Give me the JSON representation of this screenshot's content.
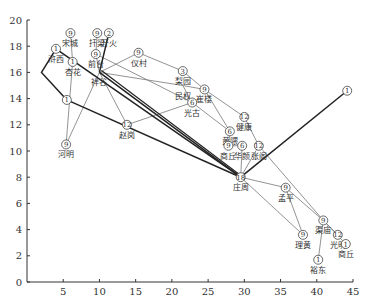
{
  "chart_data": {
    "type": "network-diagram",
    "title": "",
    "xlabel": "",
    "ylabel": "",
    "xlim": [
      0,
      45
    ],
    "ylim": [
      0,
      20
    ],
    "x_ticks": [
      5,
      10,
      15,
      20,
      25,
      30,
      35,
      40,
      45
    ],
    "y_ticks": [
      0,
      2,
      4,
      6,
      8,
      10,
      12,
      14,
      16,
      18,
      20
    ],
    "grid": false,
    "nodes": [
      {
        "id": "songcheng",
        "label": "宋城",
        "num": "9",
        "x": 6.0,
        "y": 19.0
      },
      {
        "id": "fuliang",
        "label": "扦梁",
        "num": "9",
        "x": 9.7,
        "y": 19.0
      },
      {
        "id": "kaihuo",
        "label": "开火",
        "num": "2",
        "x": 11.3,
        "y": 19.0
      },
      {
        "id": "huxi",
        "label": "浒西",
        "num": "1",
        "x": 4.0,
        "y": 17.8
      },
      {
        "id": "qiantai",
        "label": "前台",
        "num": "9",
        "x": 9.5,
        "y": 17.4
      },
      {
        "id": "yicun",
        "label": "仪村",
        "num": "9",
        "x": 15.4,
        "y": 17.5
      },
      {
        "id": "xinghua",
        "label": "杏花",
        "num": "1",
        "x": 6.3,
        "y": 16.8
      },
      {
        "id": "lishi",
        "label": "祥谷",
        "num": "",
        "x": 10.0,
        "y": 16.0
      },
      {
        "id": "liyuan",
        "label": "梨园",
        "num": "3",
        "x": 21.5,
        "y": 16.1
      },
      {
        "id": "minquan",
        "label": "民权",
        "num": "",
        "x": 21.5,
        "y": 15.0
      },
      {
        "id": "cuilou",
        "label": "崔楼",
        "num": "9",
        "x": 24.5,
        "y": 14.7
      },
      {
        "id": "guangu",
        "label": "光古",
        "num": "6",
        "x": 22.8,
        "y": 13.7
      },
      {
        "id": "zhaogang",
        "label": "赵岗",
        "num": "12",
        "x": 13.8,
        "y": 12.0
      },
      {
        "id": "junction14",
        "label": "",
        "num": "1",
        "x": 5.5,
        "y": 13.9
      },
      {
        "id": "jiankang",
        "label": "健康",
        "num": "12",
        "x": 30.0,
        "y": 12.6
      },
      {
        "id": "gaozhu",
        "label": "黄隈",
        "num": "6",
        "x": 28.0,
        "y": 11.5
      },
      {
        "id": "huajian",
        "label": "华颜",
        "num": "6",
        "x": 29.7,
        "y": 10.4
      },
      {
        "id": "shangqiu_n",
        "label": "商丘",
        "num": "9",
        "x": 27.8,
        "y": 10.4
      },
      {
        "id": "zhanglou",
        "label": "张阁",
        "num": "12",
        "x": 32.0,
        "y": 10.4
      },
      {
        "id": "heming",
        "label": "河明",
        "num": "9",
        "x": 5.4,
        "y": 10.5
      },
      {
        "id": "zhuangzhou",
        "label": "庄周",
        "num": "18",
        "x": 29.5,
        "y": 8.0
      },
      {
        "id": "east1",
        "label": "",
        "num": "1",
        "x": 44.2,
        "y": 14.6
      },
      {
        "id": "mengping",
        "label": "孟平",
        "num": "9",
        "x": 35.7,
        "y": 7.2
      },
      {
        "id": "lianmiao",
        "label": "渠庙",
        "num": "9",
        "x": 40.9,
        "y": 4.7
      },
      {
        "id": "guangming",
        "label": "光明",
        "num": "12",
        "x": 42.9,
        "y": 3.6
      },
      {
        "id": "liangying",
        "label": "理黄",
        "num": "9",
        "x": 38.1,
        "y": 3.6
      },
      {
        "id": "shangqiu_s",
        "label": "商丘",
        "num": "1",
        "x": 44.0,
        "y": 2.9
      },
      {
        "id": "yudong",
        "label": "裕东",
        "num": "1",
        "x": 40.2,
        "y": 1.7
      }
    ],
    "thick_edges": [
      [
        "huxi",
        "zhuangzhou"
      ],
      [
        "lishi",
        "zhuangzhou"
      ],
      [
        "kaihuo",
        "lishi"
      ],
      [
        "zhuangzhou",
        "east1"
      ],
      [
        "junction14",
        "zhuangzhou"
      ]
    ],
    "thin_edges": [
      [
        "songcheng",
        "xinghua"
      ],
      [
        "fuliang",
        "qiantai"
      ],
      [
        "qiantai",
        "lishi"
      ],
      [
        "yicun",
        "lishi"
      ],
      [
        "xinghua",
        "heming"
      ],
      [
        "heming",
        "lishi"
      ],
      [
        "lishi",
        "zhaogang"
      ],
      [
        "zhaogang",
        "guangu"
      ],
      [
        "lishi",
        "minquan"
      ],
      [
        "minquan",
        "cuilou"
      ],
      [
        "liyuan",
        "cuilou"
      ],
      [
        "yicun",
        "liyuan"
      ],
      [
        "minquan",
        "guangu"
      ],
      [
        "guangu",
        "gaozhu"
      ],
      [
        "cuilou",
        "jiankang"
      ],
      [
        "cuilou",
        "gaozhu"
      ],
      [
        "gaozhu",
        "shangqiu_n"
      ],
      [
        "shangqiu_n",
        "huajian"
      ],
      [
        "huajian",
        "zhuangzhou"
      ],
      [
        "jiankang",
        "zhanglou"
      ],
      [
        "zhanglou",
        "zhuangzhou"
      ],
      [
        "zhanglou",
        "lianmiao"
      ],
      [
        "zhuangzhou",
        "mengping"
      ],
      [
        "mengping",
        "lianmiao"
      ],
      [
        "mengping",
        "liangying"
      ],
      [
        "zhuangzhou",
        "liangying"
      ],
      [
        "lianmiao",
        "guangming"
      ],
      [
        "lianmiao",
        "shangqiu_s"
      ],
      [
        "lianmiao",
        "yudong"
      ],
      [
        "qiantai",
        "guangu"
      ]
    ],
    "polyline_edges": [
      [
        [
          4.0,
          17.8
        ],
        [
          2.0,
          16.0
        ],
        [
          5.5,
          13.9
        ]
      ]
    ]
  }
}
